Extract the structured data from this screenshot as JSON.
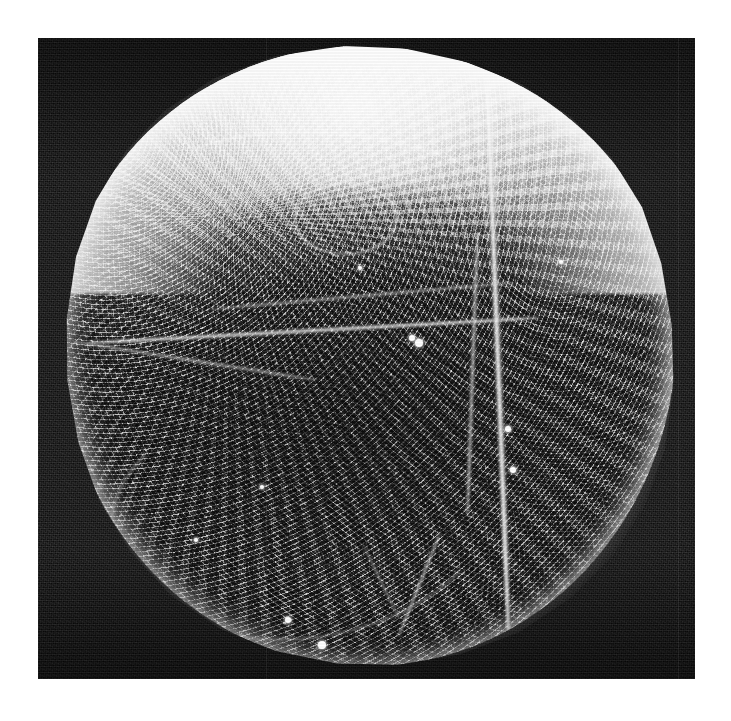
{
  "image": {
    "kind": "sem-micrograph",
    "subject": "spherical microparticle with reticulate surface",
    "canvas": {
      "width": 731,
      "height": 721,
      "background": "#ffffff"
    },
    "plate": {
      "x": 38,
      "y": 38,
      "width": 657,
      "height": 641,
      "background_color": "#121212",
      "background_description": "near-black noisy electron-detector background"
    },
    "specimen": {
      "shape": "sphere",
      "center_x": 368,
      "center_y": 356,
      "diameter_px": 616,
      "bounds": {
        "left": 60,
        "top": 46,
        "right": 676,
        "bottom": 666
      },
      "surface_texture": "reticulate / porous mesh with lumina",
      "highlight": "overexposed bright rim along the upper limb",
      "shadow": "darker grey toward lower centre",
      "colors": {
        "rim_highlight": "#ffffff",
        "upper_surface": "#e8e8e8",
        "mid_surface": "#a8a8a8",
        "lower_surface": "#7a7a7a",
        "lumina_shadow": "#3c3c3c",
        "background": "#121212"
      }
    },
    "features": [
      {
        "name": "vertical-fold-right",
        "description": "long bright fold running top to bottom on the right third"
      },
      {
        "name": "equatorial-ridge",
        "description": "bright filamentous ridge crossing the middle from the left limb"
      },
      {
        "name": "upper-arc-ridge",
        "description": "broad arc of raised reticulum across the upper hemisphere"
      },
      {
        "name": "circular-loop",
        "description": "small ring-shaped raised structure, upper right of centre"
      },
      {
        "name": "lower-branch-ridge",
        "description": "branching ridges near the lower right limb"
      },
      {
        "name": "smooth-panel",
        "description": "darker smoother panel in the lower central area"
      }
    ],
    "debris_specks": [
      {
        "x": 412,
        "y": 338,
        "r": 3
      },
      {
        "x": 419,
        "y": 343,
        "r": 4
      },
      {
        "x": 508,
        "y": 429,
        "r": 3
      },
      {
        "x": 513,
        "y": 470,
        "r": 3
      },
      {
        "x": 322,
        "y": 645,
        "r": 4
      },
      {
        "x": 288,
        "y": 620,
        "r": 3
      },
      {
        "x": 262,
        "y": 487,
        "r": 2
      },
      {
        "x": 196,
        "y": 540,
        "r": 2
      },
      {
        "x": 561,
        "y": 262,
        "r": 2
      },
      {
        "x": 360,
        "y": 268,
        "r": 2
      }
    ],
    "labels": {
      "scale_bar": "",
      "annotations": []
    }
  }
}
